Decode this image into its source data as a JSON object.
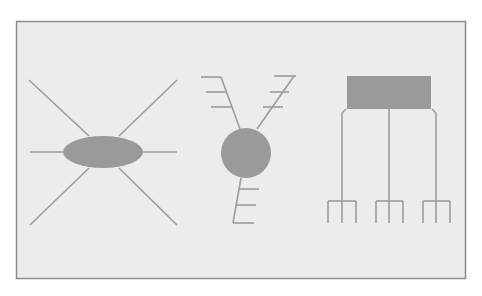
{
  "diagram": {
    "colors": {
      "page_background": "#ffffff",
      "panel_fill": "#ececec",
      "panel_border": "#8a8a8a",
      "shape_fill": "#9a9a9a",
      "line": "#9c9c9c"
    },
    "panel": {
      "x": 16,
      "y": 21,
      "width": 449,
      "height": 257
    },
    "figures": [
      {
        "id": "radial-ellipse",
        "label": "ellipse body with six radiating lines",
        "body": {
          "type": "ellipse",
          "cx": 103,
          "cy": 152,
          "rx": 40,
          "ry": 16
        },
        "lines": [
          [
            30,
            152,
            63,
            152
          ],
          [
            143,
            152,
            177,
            152
          ],
          [
            29,
            80,
            89,
            136
          ],
          [
            177,
            80,
            119,
            136
          ],
          [
            30,
            225,
            89,
            168
          ],
          [
            177,
            225,
            119,
            168
          ]
        ]
      },
      {
        "id": "branched-circle",
        "label": "circle body with three comb-like branches",
        "body": {
          "type": "circle",
          "cx": 246,
          "cy": 153,
          "r": 25
        },
        "lines": [
          [
            221,
            77,
            240,
            129
          ],
          [
            201,
            77,
            221,
            77
          ],
          [
            206,
            92,
            226,
            92
          ],
          [
            211,
            107,
            232,
            107
          ],
          [
            294,
            76,
            257,
            129
          ],
          [
            274,
            76,
            296,
            76
          ],
          [
            270,
            92,
            289,
            92
          ],
          [
            263,
            107,
            283,
            107
          ],
          [
            241,
            178,
            233,
            223
          ],
          [
            239,
            189,
            259,
            189
          ],
          [
            236,
            205,
            256,
            205
          ],
          [
            233,
            223,
            254,
            223
          ]
        ]
      },
      {
        "id": "box-tree",
        "label": "rectangle with three descending forked lines",
        "body": {
          "type": "rect",
          "x": 347,
          "y": 76,
          "width": 84,
          "height": 33
        },
        "lines": [
          [
            389,
            109,
            389,
            223
          ],
          [
            346,
            109,
            342,
            113
          ],
          [
            342,
            113,
            342,
            223
          ],
          [
            432,
            109,
            436,
            113
          ],
          [
            436,
            113,
            436,
            223
          ],
          [
            328,
            201,
            356,
            201
          ],
          [
            328,
            201,
            328,
            223
          ],
          [
            356,
            201,
            356,
            223
          ],
          [
            376,
            201,
            403,
            201
          ],
          [
            376,
            201,
            376,
            223
          ],
          [
            403,
            201,
            403,
            223
          ],
          [
            423,
            201,
            450,
            201
          ],
          [
            423,
            201,
            423,
            223
          ],
          [
            450,
            201,
            450,
            223
          ]
        ]
      }
    ]
  }
}
